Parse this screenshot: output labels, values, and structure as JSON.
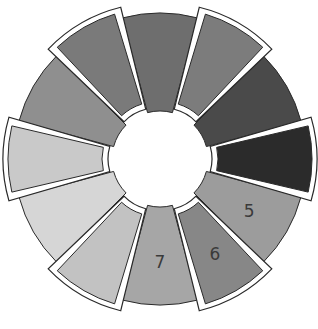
{
  "diagram": {
    "type": "segmented-ring",
    "center": [
      160,
      159
    ],
    "outer_radius": 146,
    "inner_radius": 48,
    "segment_count": 12,
    "segments": [
      {
        "index": 1,
        "angle_deg": 90,
        "color": "#6e6e6e",
        "popped": false,
        "label": ""
      },
      {
        "index": 2,
        "angle_deg": 60,
        "color": "#7c7c7c",
        "popped": true,
        "label": ""
      },
      {
        "index": 3,
        "angle_deg": 30,
        "color": "#4a4a4a",
        "popped": false,
        "label": ""
      },
      {
        "index": 4,
        "angle_deg": 0,
        "color": "#2b2b2b",
        "popped": true,
        "label": ""
      },
      {
        "index": 5,
        "angle_deg": -30,
        "color": "#9c9c9c",
        "popped": false,
        "label": "5"
      },
      {
        "index": 6,
        "angle_deg": -60,
        "color": "#878787",
        "popped": true,
        "label": "6"
      },
      {
        "index": 7,
        "angle_deg": -90,
        "color": "#a6a6a6",
        "popped": false,
        "label": "7"
      },
      {
        "index": 8,
        "angle_deg": -120,
        "color": "#c2c2c2",
        "popped": true,
        "label": ""
      },
      {
        "index": 9,
        "angle_deg": -150,
        "color": "#d6d6d6",
        "popped": false,
        "label": ""
      },
      {
        "index": 10,
        "angle_deg": 180,
        "color": "#c9c9c9",
        "popped": true,
        "label": ""
      },
      {
        "index": 11,
        "angle_deg": 150,
        "color": "#8f8f8f",
        "popped": false,
        "label": ""
      },
      {
        "index": 12,
        "angle_deg": 120,
        "color": "#7a7a7a",
        "popped": true,
        "label": ""
      }
    ],
    "visible_labels": [
      "5",
      "6",
      "7"
    ],
    "outline_color": "#2a2a2a",
    "popped_border_color": "#ffffff"
  }
}
